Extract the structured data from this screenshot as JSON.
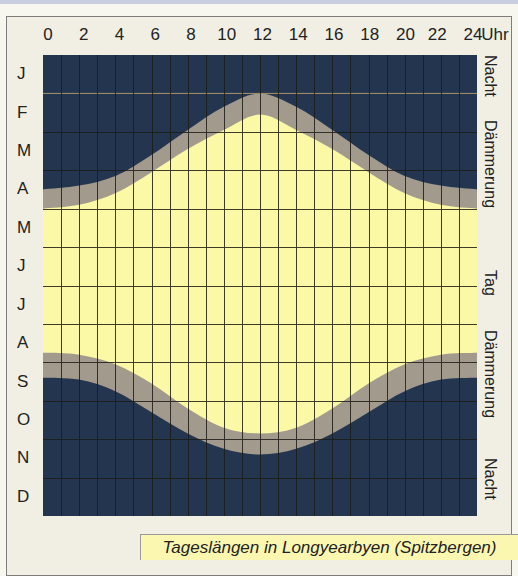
{
  "chart_data": {
    "type": "area",
    "title": "Tageslängen in Longyearbyen (Spitzbergen)",
    "xlabel": "Uhr",
    "ylabel": "",
    "x_ticks": [
      "0",
      "2",
      "4",
      "6",
      "8",
      "10",
      "12",
      "14",
      "16",
      "18",
      "20",
      "22",
      "24"
    ],
    "x_unit": "Uhr",
    "xlim": [
      0,
      24
    ],
    "y_categories": [
      "J",
      "F",
      "M",
      "A",
      "M",
      "J",
      "J",
      "A",
      "S",
      "O",
      "N",
      "D"
    ],
    "grid": true,
    "legend_position": "right-vertical",
    "zones_right_labels": [
      "Nacht",
      "Dämmerung",
      "Tag",
      "Dämmerung",
      "Nacht"
    ],
    "colors": {
      "night": "#24364f",
      "twilight": "#a39a8e",
      "day": "#fbf8a6",
      "grid": "#1c1c14",
      "frame_bg": "#f1efe3",
      "caption_bg": "#fbf7b0"
    },
    "series": [
      {
        "name": "Nacht→Dämmerung (Beginn der Dämmerung, obere Grenze)",
        "description": "month position (0=Jan start,12=Dec end) where twilight starts, per hour",
        "x": [
          0,
          2,
          4,
          6,
          8,
          10,
          12,
          14,
          16,
          18,
          20,
          22,
          24
        ],
        "values": [
          3.5,
          3.4,
          3.15,
          2.6,
          1.95,
          1.35,
          1.0,
          1.35,
          1.95,
          2.6,
          3.15,
          3.4,
          3.5
        ]
      },
      {
        "name": "Dämmerung→Tag (Beginn Tag, obere Grenze)",
        "x": [
          0,
          2,
          4,
          6,
          8,
          10,
          12,
          14,
          16,
          18,
          20,
          22,
          24
        ],
        "values": [
          4.0,
          3.9,
          3.6,
          3.05,
          2.45,
          1.95,
          1.55,
          1.95,
          2.45,
          3.05,
          3.6,
          3.9,
          4.0
        ]
      },
      {
        "name": "Tag→Dämmerung (Ende Tag, untere Grenze)",
        "x": [
          0,
          2,
          4,
          6,
          8,
          10,
          12,
          14,
          16,
          18,
          20,
          22,
          24
        ],
        "values": [
          7.75,
          7.8,
          8.05,
          8.55,
          9.2,
          9.7,
          9.85,
          9.7,
          9.2,
          8.55,
          8.05,
          7.8,
          7.75
        ]
      },
      {
        "name": "Dämmerung→Nacht (Ende Dämmerung, untere Grenze)",
        "x": [
          0,
          2,
          4,
          6,
          8,
          10,
          12,
          14,
          16,
          18,
          20,
          22,
          24
        ],
        "values": [
          8.4,
          8.45,
          8.75,
          9.3,
          9.85,
          10.25,
          10.4,
          10.25,
          9.85,
          9.3,
          8.75,
          8.45,
          8.4
        ]
      }
    ]
  },
  "axis": {
    "hours": [
      "0",
      "2",
      "4",
      "6",
      "8",
      "10",
      "12",
      "14",
      "16",
      "18",
      "20",
      "22",
      "24"
    ],
    "unit_label": "Uhr",
    "months": [
      "J",
      "F",
      "M",
      "A",
      "M",
      "J",
      "J",
      "A",
      "S",
      "O",
      "N",
      "D"
    ]
  },
  "side_labels": [
    {
      "text": "Nacht",
      "top": 55
    },
    {
      "text": "Dämmerung",
      "top": 120
    },
    {
      "text": "Tag",
      "top": 270
    },
    {
      "text": "Dämmerung",
      "top": 330
    },
    {
      "text": "Nacht",
      "top": 458
    }
  ],
  "caption": "Tageslängen in Longyearbyen (Spitzbergen)"
}
